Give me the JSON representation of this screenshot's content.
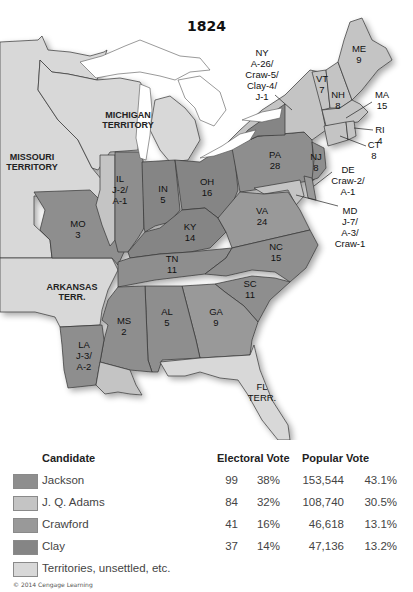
{
  "title": "1824",
  "colors": {
    "jackson": "#8e8e8e",
    "adams": "#c4c4c4",
    "crawford": "#999999",
    "clay": "#858585",
    "territory": "#d8d8d8",
    "water": "#ffffff"
  },
  "map_labels": {
    "missouri_territory": [
      "MISSOURI",
      "TERRITORY"
    ],
    "michigan_territory": [
      "MICHIGAN",
      "TERRITORY"
    ],
    "arkansas_territory": [
      "ARKANSAS",
      "TERR."
    ],
    "florida_territory": [
      "FL",
      "TERR."
    ],
    "states": {
      "NY": [
        "NY",
        "A-26/",
        "Craw-5/",
        "Clay-4/",
        "J-1"
      ],
      "ME": [
        "ME",
        "9"
      ],
      "VT": [
        "VT",
        "7"
      ],
      "NH": [
        "NH",
        "8"
      ],
      "MA": [
        "MA",
        "15"
      ],
      "RI": [
        "RI",
        "4"
      ],
      "CT": [
        "CT",
        "8"
      ],
      "NJ": [
        "NJ",
        "8"
      ],
      "DE": [
        "DE",
        "Craw-2/",
        "A-1"
      ],
      "MD": [
        "MD",
        "J-7/",
        "A-3/",
        "Craw-1"
      ],
      "PA": [
        "PA",
        "28"
      ],
      "OH": [
        "OH",
        "16"
      ],
      "IN": [
        "IN",
        "5"
      ],
      "IL": [
        "IL",
        "J-2/",
        "A-1"
      ],
      "MO": [
        "MO",
        "3"
      ],
      "KY": [
        "KY",
        "14"
      ],
      "VA": [
        "VA",
        "24"
      ],
      "NC": [
        "NC",
        "15"
      ],
      "TN": [
        "TN",
        "11"
      ],
      "SC": [
        "SC",
        "11"
      ],
      "GA": [
        "GA",
        "9"
      ],
      "AL": [
        "AL",
        "5"
      ],
      "MS": [
        "MS",
        "2"
      ],
      "LA": [
        "LA",
        "J-3/",
        "A-2"
      ]
    }
  },
  "legend": {
    "headers": {
      "candidate": "Candidate",
      "electoral": "Electoral Vote",
      "popular": "Popular Vote"
    },
    "rows": [
      {
        "name": "Jackson",
        "color_key": "jackson",
        "electoral": "99",
        "electoral_pct": "38%",
        "popular": "153,544",
        "popular_pct": "43.1%"
      },
      {
        "name": "J. Q. Adams",
        "color_key": "adams",
        "electoral": "84",
        "electoral_pct": "32%",
        "popular": "108,740",
        "popular_pct": "30.5%"
      },
      {
        "name": "Crawford",
        "color_key": "crawford",
        "electoral": "41",
        "electoral_pct": "16%",
        "popular": "46,618",
        "popular_pct": "13.1%"
      },
      {
        "name": "Clay",
        "color_key": "clay",
        "electoral": "37",
        "electoral_pct": "14%",
        "popular": "47,136",
        "popular_pct": "13.2%"
      },
      {
        "name": "Territories, unsettled, etc.",
        "color_key": "territory"
      }
    ]
  },
  "copyright": "© 2014 Cengage Learning"
}
